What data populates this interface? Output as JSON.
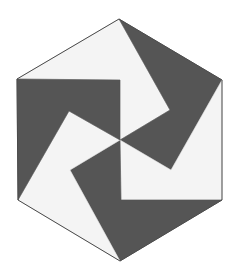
{
  "figure": {
    "title": "",
    "colors": {
      "dark": "#555555",
      "light": "#f4f4f4",
      "stroke": "#4a4a4a",
      "background": "#ffffff"
    },
    "hexagon": {
      "vertices": [
        [
          119,
          19
        ],
        [
          222,
          80
        ],
        [
          222,
          200
        ],
        [
          120,
          261
        ],
        [
          18,
          200
        ],
        [
          17,
          79
        ]
      ],
      "center": [
        120,
        140
      ]
    },
    "pieces": [
      {
        "name": "top-light",
        "tone": "light",
        "points": "17,79 119,19 170,110 120,140 120,80"
      },
      {
        "name": "upper-right-dark",
        "tone": "dark",
        "points": "119,19 222,80 171,170 120,140 170,110"
      },
      {
        "name": "right-light",
        "tone": "light",
        "points": "222,80 222,200 121,200 120,140 171,170"
      },
      {
        "name": "bottom-dark",
        "tone": "dark",
        "points": "222,200 120,261 70,170 120,140 121,200"
      },
      {
        "name": "lower-left-light",
        "tone": "light",
        "points": "120,261 18,200 69,111 120,140 70,170"
      },
      {
        "name": "left-dark",
        "tone": "dark",
        "points": "18,200 17,79 120,80 120,140 69,111"
      }
    ]
  }
}
